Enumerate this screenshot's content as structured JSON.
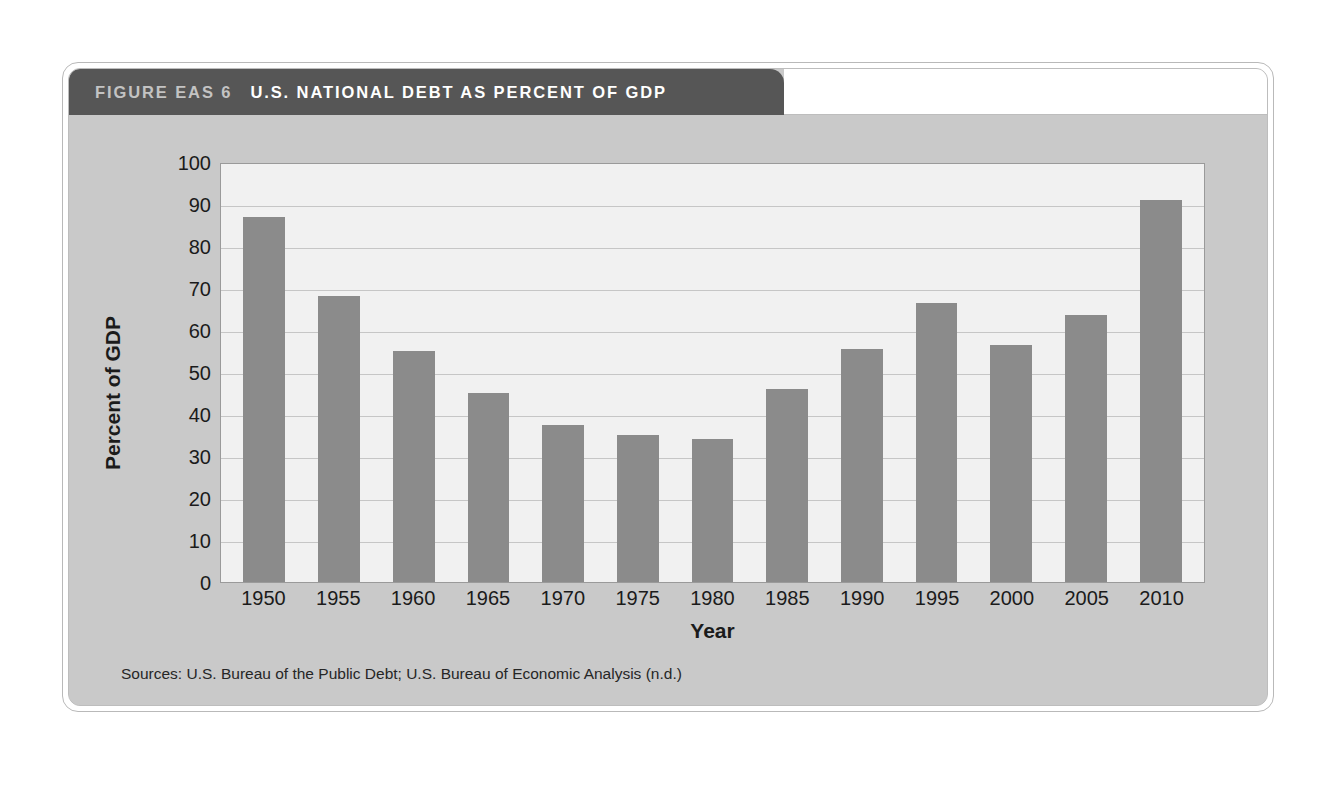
{
  "figure": {
    "label": "FIGURE EAS 6",
    "title": "U.S. NATIONAL DEBT AS PERCENT OF GDP",
    "source_note": "Sources: U.S. Bureau of the Public Debt; U.S. Bureau of Economic Analysis (n.d.)"
  },
  "colors": {
    "title_bar": "#565656",
    "figure_background": "#c9c9c9",
    "plot_background": "#f1f1f1",
    "bar": "#8b8b8b",
    "gridline": "#c6c6c6",
    "axis_line": "#9a9a9a",
    "label_text": "#c3c3c3",
    "title_text": "#ffffff"
  },
  "chart_data": {
    "type": "bar",
    "title": "U.S. NATIONAL DEBT AS PERCENT OF GDP",
    "xlabel": "Year",
    "ylabel": "Percent of GDP",
    "categories": [
      "1950",
      "1955",
      "1960",
      "1965",
      "1970",
      "1975",
      "1980",
      "1985",
      "1990",
      "1995",
      "2000",
      "2005",
      "2010"
    ],
    "values": [
      87,
      68,
      55,
      45,
      37.5,
      35,
      34,
      46,
      55.5,
      66.5,
      56.5,
      63.5,
      91
    ],
    "ylim": [
      0,
      100
    ],
    "yticks": [
      0,
      10,
      20,
      30,
      40,
      50,
      60,
      70,
      80,
      90,
      100
    ],
    "ytick_labels": [
      "0",
      "10",
      "20",
      "30",
      "40",
      "50",
      "60",
      "70",
      "80",
      "90",
      "100"
    ],
    "grid": true,
    "legend": false,
    "source": "Sources: U.S. Bureau of the Public Debt; U.S. Bureau of Economic Analysis (n.d.)"
  }
}
